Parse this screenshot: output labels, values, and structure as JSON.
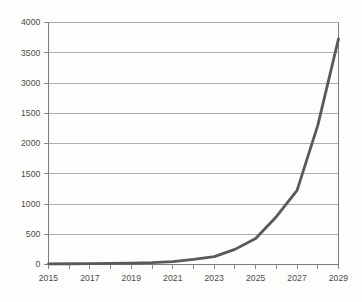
{
  "chart_data": {
    "type": "line",
    "title": "",
    "subtitle": "",
    "xlabel": "",
    "ylabel": "",
    "xlim": [
      2015,
      2029
    ],
    "ylim": [
      0,
      4000
    ],
    "grid": true,
    "legend": false,
    "legend_position": "none",
    "series_color": "#595959",
    "gridline_color": "#9a9a9a",
    "axis_color": "#7d7d7d",
    "tick_label_color": "#4a4a4a",
    "background_color": "#fdfdfc",
    "x": [
      2015,
      2016,
      2017,
      2018,
      2019,
      2020,
      2021,
      2022,
      2023,
      2024,
      2025,
      2026,
      2027,
      2028,
      2029
    ],
    "series": [
      {
        "name": "value",
        "values": [
          10,
          12,
          15,
          18,
          22,
          30,
          48,
          85,
          130,
          250,
          430,
          790,
          1225,
          2300,
          3730
        ]
      }
    ],
    "y_tick_values": [
      0,
      500,
      1000,
      1500,
      2000,
      2500,
      3000,
      3500,
      4000
    ],
    "y_tick_labels": [
      "0",
      "500",
      "1000",
      "1500",
      "2000",
      "1500",
      "3000",
      "3500",
      "4000"
    ],
    "x_tick_values": [
      2015,
      2016,
      2017,
      2018,
      2019,
      2020,
      2021,
      2022,
      2023,
      2024,
      2025,
      2026,
      2027,
      2028,
      2029
    ],
    "x_tick_labels": [
      "2015",
      "",
      "2017",
      "",
      "2019",
      "",
      "2021",
      "",
      "2023",
      "",
      "2025",
      "",
      "2027",
      "",
      "2029"
    ]
  }
}
